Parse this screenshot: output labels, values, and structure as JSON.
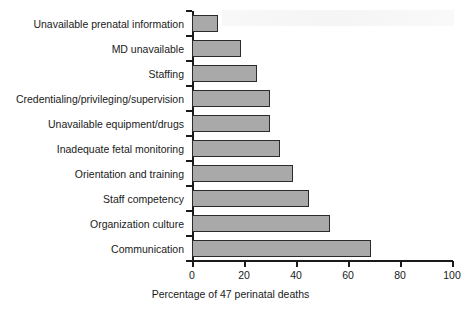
{
  "chart_data": {
    "type": "bar",
    "orientation": "horizontal",
    "title": "",
    "xlabel": "Percentage of 47 perinatal deaths",
    "ylabel": "",
    "xlim": [
      0,
      100
    ],
    "xticks": [
      0,
      20,
      40,
      60,
      80,
      100
    ],
    "grid": false,
    "legend": null,
    "categories": [
      "Unavailable prenatal information",
      "MD unavailable",
      "Staffing",
      "Credentialing/privileging/supervision",
      "Unavailable equipment/drugs",
      "Inadequate fetal monitoring",
      "Orientation and training",
      "Staff competency",
      "Organization culture",
      "Communication"
    ],
    "values": [
      10,
      19,
      25,
      30,
      30,
      34,
      39,
      45,
      53,
      69
    ],
    "bar_color": "#a9a9a9",
    "bar_edge_color": "#2b2b2b",
    "axis_color": "#1a1a1a",
    "background": "#ffffff"
  }
}
